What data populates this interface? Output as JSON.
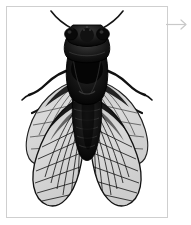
{
  "panel": {
    "frame_border_color": "#cfcfcf",
    "background_color": "#ffffff",
    "caption": "",
    "specimen": {
      "common_name": "Cicada",
      "view": "dorsal",
      "rendering": "black-and-white engraving",
      "body_color": "#0d0d0d",
      "wing_membrane_color": "#d8d8d8",
      "wing_vein_color": "#1a1a1a",
      "parts": [
        "antenna-left",
        "antenna-right",
        "head",
        "compound-eye-left",
        "compound-eye-right",
        "pronotum",
        "mesonotum",
        "abdomen",
        "forewing-left",
        "forewing-right",
        "hindwing-left",
        "hindwing-right",
        "leg-fore-left",
        "leg-fore-right",
        "leg-mid-left",
        "leg-mid-right",
        "leg-hind-left",
        "leg-hind-right"
      ]
    }
  },
  "navigation": {
    "next_arrow_label": "→",
    "next_arrow_color": "#c9c9c9"
  }
}
